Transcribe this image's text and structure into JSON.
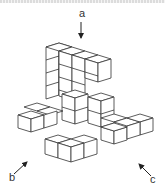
{
  "figure": {
    "type": "isometric-cube-structure",
    "line_color": "#333333",
    "face_color": "#ffffff"
  },
  "views": [
    {
      "label": "a",
      "direction": "top",
      "arrow": "down-arrow"
    },
    {
      "label": "b",
      "direction": "front-left",
      "arrow": "up-right-arrow"
    },
    {
      "label": "c",
      "direction": "front-right",
      "arrow": "up-left-arrow"
    }
  ]
}
